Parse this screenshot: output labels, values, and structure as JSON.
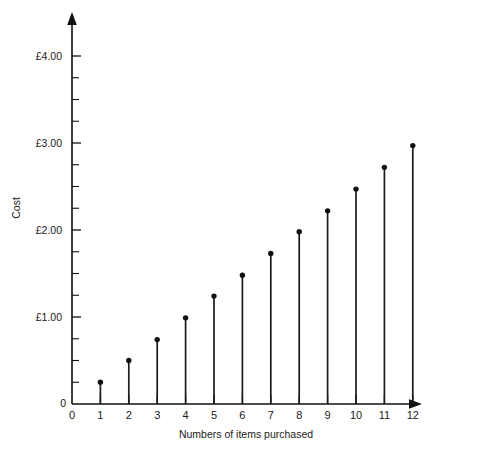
{
  "chart_data": {
    "type": "scatter",
    "render_style": "stem",
    "title": "",
    "subtitle": "",
    "xlabel": "Numbers of items purchased",
    "ylabel": "Cost",
    "x": [
      1,
      2,
      3,
      4,
      5,
      6,
      7,
      8,
      9,
      10,
      11,
      12
    ],
    "values": [
      0.25,
      0.5,
      0.74,
      0.99,
      1.24,
      1.48,
      1.73,
      1.98,
      2.22,
      2.47,
      2.72,
      2.97
    ],
    "categories": [
      "1",
      "2",
      "3",
      "4",
      "5",
      "6",
      "7",
      "8",
      "9",
      "10",
      "11",
      "12"
    ],
    "series": [
      {
        "name": "Cost",
        "values": [
          0.25,
          0.5,
          0.74,
          0.99,
          1.24,
          1.48,
          1.73,
          1.98,
          2.22,
          2.47,
          2.72,
          2.97
        ]
      }
    ],
    "xlim": [
      0,
      12
    ],
    "ylim": [
      0,
      4.3
    ],
    "x_tick_labels": [
      "0",
      "1",
      "2",
      "3",
      "4",
      "5",
      "6",
      "7",
      "8",
      "9",
      "10",
      "11",
      "12"
    ],
    "x_tick_values": [
      0,
      1,
      2,
      3,
      4,
      5,
      6,
      7,
      8,
      9,
      10,
      11,
      12
    ],
    "y_tick_labels": [
      "£1.00",
      "£2.00",
      "£3.00",
      "£4.00"
    ],
    "y_tick_values": [
      1,
      2,
      3,
      4
    ],
    "y_minor_step": 0.25,
    "y_origin_label": "0",
    "x_origin_label": "0",
    "grid": false,
    "legend": false,
    "legend_position": "none",
    "axis_arrows": true,
    "marker": "filled-circle",
    "currency_symbol": "£",
    "colors": {
      "background": "#ffffff",
      "axis": "#111111",
      "marker": "#111111",
      "stem": "#1b1b1b",
      "text": "#1a1a1a"
    }
  }
}
